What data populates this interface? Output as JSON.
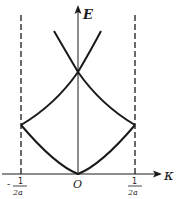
{
  "diagram": {
    "axes": {
      "y_label": "E",
      "x_label": "κ",
      "origin_label": "O"
    },
    "ticks": {
      "left": {
        "numerator": "1",
        "denominator": "2a",
        "sign": "-"
      },
      "right": {
        "numerator": "1",
        "denominator": "2a"
      }
    },
    "boundaries": {
      "left": "-1/2a",
      "right": "1/2a",
      "style": "dashed"
    },
    "curves": [
      {
        "name": "lower-band",
        "description": "parabola from origin rising to zone boundaries"
      },
      {
        "name": "second-band",
        "description": "folded branches from zone boundaries crossing at κ=0"
      },
      {
        "name": "third-band",
        "description": "branches rising above crossing point"
      }
    ],
    "colors": {
      "stroke": "#1a1a1a",
      "background": "#ffffff"
    }
  }
}
